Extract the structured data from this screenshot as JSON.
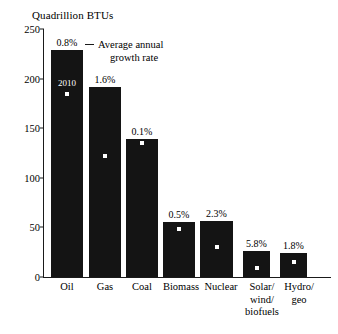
{
  "chart_data": {
    "type": "bar",
    "title": "Quadrillion BTUs",
    "xlabel": "",
    "ylabel": "Quadrillion BTUs",
    "ylim": [
      0,
      250
    ],
    "yticks": [
      0,
      50,
      100,
      150,
      200,
      250
    ],
    "ytick_labels": [
      "0",
      "50",
      "100",
      "150",
      "200",
      "250"
    ],
    "grid": false,
    "legend": {
      "position": "top-center",
      "marker": "line",
      "line1": "Average annual",
      "line2": "growth rate",
      "full_text": "Average annual growth rate"
    },
    "categories": [
      "Oil",
      "Gas",
      "Coal",
      "Biomass",
      "Nuclear",
      "Solar/\nwind/\nbiofuels",
      "Hydro/\ngeo"
    ],
    "series": [
      {
        "name": "Projected",
        "type": "bar",
        "values": [
          229,
          192,
          139,
          55,
          56,
          26,
          24
        ]
      },
      {
        "name": "2010",
        "type": "point-marker",
        "values": [
          184,
          122,
          135,
          48,
          30,
          9,
          15
        ]
      }
    ],
    "data_labels": {
      "name": "Average annual growth rate",
      "values": [
        "0.8%",
        "1.6%",
        "0.1%",
        "0.5%",
        "2.3%",
        "5.8%",
        "1.8%"
      ]
    },
    "annotations": [
      {
        "text": "2010",
        "category": "Oil",
        "description": "white in-bar label marking the 2010 data point marker"
      }
    ]
  },
  "colors": {
    "bar_fill": "#141414",
    "marker": "#ffffff",
    "axis": "#1a1a1a",
    "background": "#ffffff",
    "text": "#000000"
  }
}
